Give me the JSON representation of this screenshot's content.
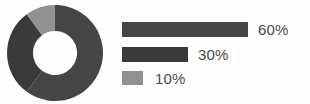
{
  "chart_data": {
    "type": "pie",
    "variant": "donut",
    "title": "",
    "subtitle": "",
    "xlabel": "",
    "ylabel": "",
    "grid": false,
    "legend_position": "right",
    "legend_style": "horizontal-bars-proportional",
    "categories": [
      "60%",
      "30%",
      "10%"
    ],
    "values": [
      60,
      30,
      10
    ],
    "labels": [
      "60%",
      "30%",
      "10%"
    ],
    "slices": [
      {
        "label": "60%",
        "value": 60,
        "color": "#454545",
        "start_angle": 0,
        "end_angle": 216
      },
      {
        "label": "30%",
        "value": 30,
        "color": "#3a3a3a",
        "start_angle": 216,
        "end_angle": 324
      },
      {
        "label": "10%",
        "value": 10,
        "color": "#909090",
        "start_angle": 324,
        "end_angle": 360
      }
    ],
    "total": 100,
    "units": "percent",
    "donut_hole_ratio": 0.46,
    "start_angle_deg": 0,
    "direction": "clockwise"
  },
  "legend": {
    "items": [
      {
        "label": "60%",
        "value": 60,
        "color": "#454545",
        "bar_width_px": 126
      },
      {
        "label": "30%",
        "value": 30,
        "color": "#3a3a3a",
        "bar_width_px": 66
      },
      {
        "label": "10%",
        "value": 10,
        "color": "#909090",
        "bar_width_px": 21
      }
    ]
  },
  "colors": {
    "background": "#fefefe",
    "series_1": "#454545",
    "series_2": "#3a3a3a",
    "series_3": "#909090",
    "text": "#4a4a4a",
    "hole": "#ffffff"
  }
}
